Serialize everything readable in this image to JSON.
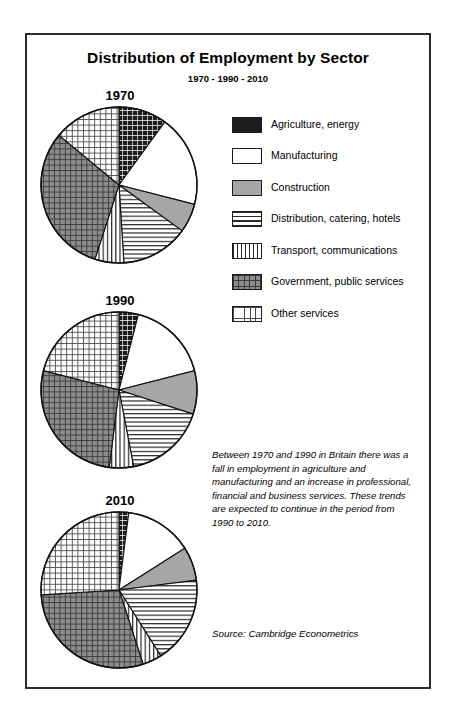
{
  "header": {
    "title": "Distribution of Employment by Sector",
    "subtitle": "1970 - 1990 - 2010"
  },
  "legend": {
    "items": [
      {
        "label": "Agriculture, energy",
        "pattern": "grid-dense-dark",
        "swatch_name": "legend-swatch-agriculture"
      },
      {
        "label": "Manufacturing",
        "pattern": "solid-white",
        "swatch_name": "legend-swatch-manufacturing"
      },
      {
        "label": "Construction",
        "pattern": "solid-gray",
        "swatch_name": "legend-swatch-construction"
      },
      {
        "label": "Distribution, catering, hotels",
        "pattern": "horizontal-lines",
        "swatch_name": "legend-swatch-distribution"
      },
      {
        "label": "Transport, communications",
        "pattern": "vertical-lines",
        "swatch_name": "legend-swatch-transport"
      },
      {
        "label": "Government, public services",
        "pattern": "grid-gray-dark",
        "swatch_name": "legend-swatch-government"
      },
      {
        "label": "Other services",
        "pattern": "grid-light",
        "swatch_name": "legend-swatch-other"
      }
    ]
  },
  "note": "Between 1970 and 1990 in Britain there was a fall in employment in agriculture and manufacturing and an increase in professional, financial and business services. These trends are expected to continue in the period from 1990 to 2010.",
  "source": "Source: Cambridge Econometrics",
  "year_labels": {
    "y1970": "1970",
    "y1990": "1990",
    "y2010": "2010"
  },
  "chart_data": {
    "type": "pie",
    "title": "Distribution of Employment by Sector",
    "subtitle": "1970 - 1990 - 2010",
    "unit": "percent share of employment",
    "legend_position": "right",
    "categories": [
      "Agriculture, energy",
      "Manufacturing",
      "Construction",
      "Distribution, catering, hotels",
      "Transport, communications",
      "Government, public services",
      "Other services"
    ],
    "series": [
      {
        "name": "1970",
        "values": [
          10,
          19,
          6,
          14,
          6,
          31,
          14
        ]
      },
      {
        "name": "1990",
        "values": [
          4,
          17,
          9,
          17,
          5,
          27,
          21
        ]
      },
      {
        "name": "2010",
        "values": [
          2,
          14,
          7,
          18,
          4,
          29,
          26
        ]
      }
    ],
    "annotation": "Between 1970 and 1990 in Britain there was a fall in employment in agriculture and manufacturing and an increase in professional, financial and business services. These trends are expected to continue in the period from 1990 to 2010.",
    "source": "Source: Cambridge Econometrics"
  },
  "colors": {
    "border": "#2b2b2b",
    "ink": "#000000",
    "gray_fill": "#a6a6a6",
    "paper": "#ffffff"
  }
}
